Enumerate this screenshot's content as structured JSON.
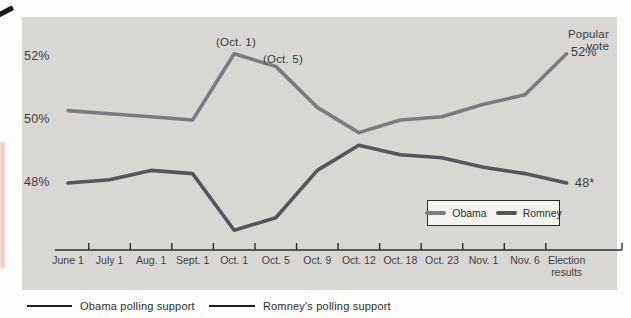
{
  "figure": {
    "background_color": "#fdfdfb",
    "panel_color": "#d8d7d3",
    "text_color": "#3b3b3d",
    "axis_color": "#2b2b2d"
  },
  "chart_data": {
    "type": "line",
    "categories": [
      "June 1",
      "July 1",
      "Aug. 1",
      "Sept. 1",
      "Oct. 1",
      "Oct. 5",
      "Oct. 9",
      "Oct. 12",
      "Oct. 18",
      "Oct. 23",
      "Nov. 1",
      "Nov. 6",
      "Election results"
    ],
    "series": [
      {
        "name": "Obama",
        "color": "#7b7c7f",
        "values": [
          50.3,
          50.2,
          50.1,
          50.0,
          52.1,
          51.7,
          50.4,
          49.6,
          50.0,
          50.1,
          50.5,
          50.8,
          52.1
        ]
      },
      {
        "name": "Romney",
        "color": "#56565a",
        "values": [
          48.0,
          48.1,
          48.4,
          48.3,
          46.5,
          46.9,
          48.4,
          49.2,
          48.9,
          48.8,
          48.5,
          48.3,
          48.0
        ]
      }
    ],
    "yticks": [
      {
        "label": "52%",
        "value": 52
      },
      {
        "label": "50%",
        "value": 50
      },
      {
        "label": "48%",
        "value": 48
      }
    ],
    "ylim": [
      46,
      53
    ],
    "grid": false,
    "legend_position": "inside-bottom-right",
    "annotations": [
      {
        "text": "(Oct. 1)",
        "target": "Obama peak Oct. 1"
      },
      {
        "text": "(Oct. 5)",
        "target": "Obama Oct. 5"
      },
      {
        "text": "Popular vote",
        "target": "Obama election result"
      },
      {
        "text": "52%",
        "target": "Obama election result value"
      },
      {
        "text": "48*",
        "target": "Romney election result value"
      }
    ]
  },
  "annotations": {
    "oct1": "(Oct. 1)",
    "oct5": "(Oct. 5)",
    "popular_vote": "Popular vote",
    "popular_vote_value": "52%",
    "romney_final_value": "48*"
  },
  "legend": {
    "obama": "Obama",
    "romney": "Romney"
  },
  "caption": {
    "obama": "Obama polling support",
    "romney": "Romney's polling support"
  }
}
